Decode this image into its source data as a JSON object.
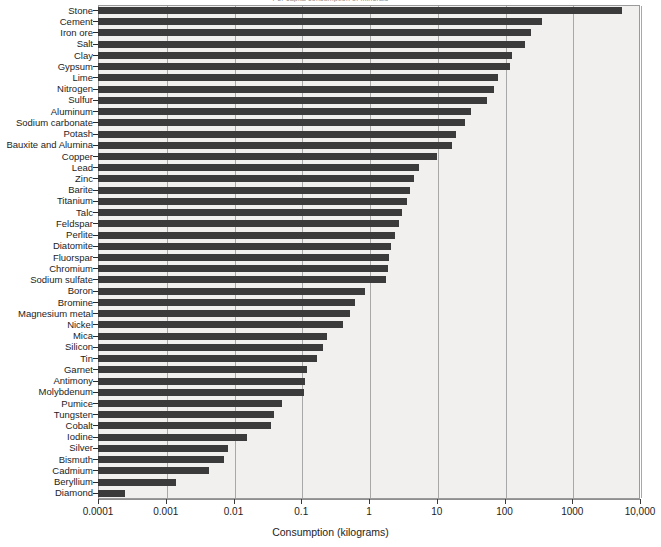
{
  "chart_data": {
    "type": "bar",
    "orientation": "horizontal",
    "title": "Per capita consumption of minerals",
    "xlabel": "Consumption (kilograms)",
    "ylabel": "",
    "xscale": "log",
    "xlim": [
      0.0001,
      10000
    ],
    "grid": true,
    "legend": false,
    "bar_color": "#3b3b3b",
    "plot_background": "#f1f0ee",
    "xtick_labels": [
      "0.0001",
      "0.001",
      "0.01",
      "0.1",
      "1",
      "10",
      "100",
      "1000",
      "10,000"
    ],
    "xtick_values": [
      0.0001,
      0.001,
      0.01,
      0.1,
      1,
      10,
      100,
      1000,
      10000
    ],
    "categories": [
      "Stone",
      "Cement",
      "Iron ore",
      "Salt",
      "Clay",
      "Gypsum",
      "Lime",
      "Nitrogen",
      "Sulfur",
      "Aluminum",
      "Sodium carbonate",
      "Potash",
      "Bauxite and Alumina",
      "Copper",
      "Lead",
      "Zinc",
      "Barite",
      "Titanium",
      "Talc",
      "Feldspar",
      "Perlite",
      "Diatomite",
      "Fluorspar",
      "Chromium",
      "Sodium sulfate",
      "Boron",
      "Bromine",
      "Magnesium metal",
      "Nickel",
      "Mica",
      "Silicon",
      "Tin",
      "Garnet",
      "Antimony",
      "Molybdenum",
      "Pumice",
      "Tungsten",
      "Cobalt",
      "Iodine",
      "Silver",
      "Bismuth",
      "Cadmium",
      "Beryllium",
      "Diamond"
    ],
    "values": [
      5500,
      360,
      250,
      200,
      130,
      120,
      80,
      70,
      55,
      32,
      26,
      19,
      17,
      10,
      5.5,
      4.6,
      4.0,
      3.6,
      3.1,
      2.8,
      2.4,
      2.1,
      2.0,
      1.9,
      1.8,
      0.88,
      0.62,
      0.52,
      0.42,
      0.24,
      0.21,
      0.17,
      0.12,
      0.115,
      0.11,
      0.052,
      0.04,
      0.036,
      0.016,
      0.0082,
      0.0072,
      0.0044,
      0.0014,
      0.00025
    ]
  }
}
